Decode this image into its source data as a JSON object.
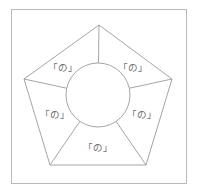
{
  "figure": {
    "title": "",
    "frame": {
      "x": 11,
      "y": 9,
      "width": 175,
      "height": 174,
      "stroke_color": "#b9b9b9"
    },
    "stroke_color": "#9a9a9a",
    "background_color": "#ffffff",
    "label_color": "#6e6e6e"
  },
  "pentagon": {
    "name": "regular-pentagon",
    "sides": 5,
    "center": {
      "x": 98,
      "y": 100
    },
    "vertices": [
      {
        "index": 0,
        "position": "top",
        "x": 99,
        "y": 25
      },
      {
        "index": 1,
        "position": "right",
        "x": 172,
        "y": 79
      },
      {
        "index": 2,
        "position": "bottom-right",
        "x": 146,
        "y": 165
      },
      {
        "index": 3,
        "position": "bottom-left",
        "x": 50,
        "y": 165
      },
      {
        "index": 4,
        "position": "left",
        "x": 24,
        "y": 79
      }
    ]
  },
  "circle": {
    "name": "inscribed-circle",
    "center": {
      "x": 98,
      "y": 95
    },
    "radius": 32
  },
  "spokes": [
    {
      "index": 0,
      "to_vertex": "top"
    },
    {
      "index": 1,
      "to_vertex": "right"
    },
    {
      "index": 2,
      "to_vertex": "bottom-right"
    },
    {
      "index": 3,
      "to_vertex": "bottom-left"
    },
    {
      "index": 4,
      "to_vertex": "left"
    }
  ],
  "sectors": [
    {
      "index": 0,
      "position": "upper-left",
      "label": "「の」",
      "x": 63,
      "y": 68
    },
    {
      "index": 1,
      "position": "upper-right",
      "label": "「の」",
      "x": 133,
      "y": 68
    },
    {
      "index": 2,
      "position": "lower-left",
      "label": "「の」",
      "x": 55,
      "y": 115
    },
    {
      "index": 3,
      "position": "lower-right",
      "label": "「の」",
      "x": 142,
      "y": 115
    },
    {
      "index": 4,
      "position": "bottom",
      "label": "「の」",
      "x": 98,
      "y": 148
    }
  ]
}
